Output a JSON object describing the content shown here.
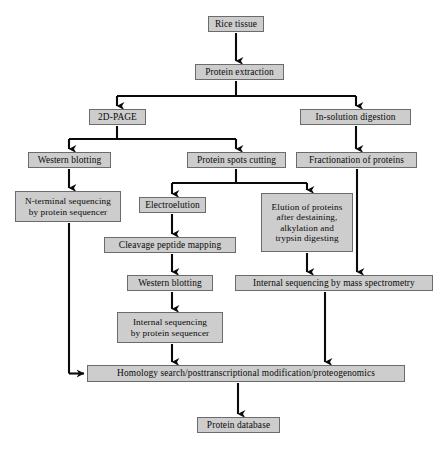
{
  "diagram": {
    "type": "flowchart",
    "orientation": "top-to-bottom",
    "palette": {
      "node_fill": "#cdcdcd",
      "node_border": "#6b6b6b",
      "connector": "#0a0a0a",
      "background": "#ffffff",
      "text": "#0a0a0a"
    },
    "nodes": [
      {
        "id": "rice",
        "label": "Rice tissue"
      },
      {
        "id": "extract",
        "label": "Protein extraction"
      },
      {
        "id": "twod",
        "label": "2D-PAGE"
      },
      {
        "id": "insol",
        "label": "In-solution digestion"
      },
      {
        "id": "western1",
        "label": "Western blotting"
      },
      {
        "id": "spots",
        "label": "Protein spots cutting"
      },
      {
        "id": "fraction",
        "label": "Fractionation of proteins"
      },
      {
        "id": "nterm",
        "label": "N-terminal sequencing\nby protein sequencer"
      },
      {
        "id": "electro",
        "label": "Electroelution"
      },
      {
        "id": "elution",
        "label": "Elution of proteins\nafter destaining,\nalkylation and\ntrypsin digesting"
      },
      {
        "id": "cleavage",
        "label": "Cleavage peptide mapping"
      },
      {
        "id": "western2",
        "label": "Western blotting"
      },
      {
        "id": "intms",
        "label": "Internal sequencing by mass spectrometry"
      },
      {
        "id": "intprot",
        "label": "Internal sequencing\nby protein sequencer"
      },
      {
        "id": "homology",
        "label": "Homology search/posttranscriptional modification/proteogenomics"
      },
      {
        "id": "database",
        "label": "Protein database"
      }
    ],
    "edges": [
      {
        "from": "rice",
        "to": "extract"
      },
      {
        "from": "extract",
        "to": "twod"
      },
      {
        "from": "extract",
        "to": "insol"
      },
      {
        "from": "twod",
        "to": "western1"
      },
      {
        "from": "twod",
        "to": "spots"
      },
      {
        "from": "insol",
        "to": "fraction"
      },
      {
        "from": "western1",
        "to": "nterm"
      },
      {
        "from": "spots",
        "to": "electro"
      },
      {
        "from": "spots",
        "to": "elution"
      },
      {
        "from": "fraction",
        "to": "intms"
      },
      {
        "from": "electro",
        "to": "cleavage"
      },
      {
        "from": "elution",
        "to": "intms"
      },
      {
        "from": "cleavage",
        "to": "western2"
      },
      {
        "from": "western2",
        "to": "intprot"
      },
      {
        "from": "nterm",
        "to": "homology"
      },
      {
        "from": "intprot",
        "to": "homology"
      },
      {
        "from": "intms",
        "to": "homology"
      },
      {
        "from": "homology",
        "to": "database"
      }
    ]
  }
}
